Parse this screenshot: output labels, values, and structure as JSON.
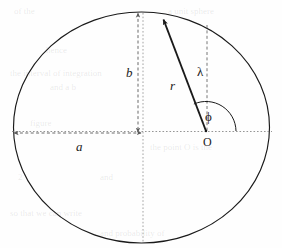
{
  "figure": {
    "type": "geometry-diagram",
    "background_color": "#fefefe",
    "stroke_color": "#1a1a1a",
    "guide_color": "#8a8a8a"
  },
  "labels": {
    "semi_major_axis": "a",
    "semi_minor_axis": "b",
    "radius": "r",
    "vertical_offset": "λ",
    "angle": "ϕ",
    "origin": "O"
  },
  "chart_data": {
    "type": "scatter",
    "title": "",
    "xlabel": "",
    "ylabel": "",
    "annotations": [
      {
        "name": "a",
        "text": "a",
        "meaning": "semi-major-axis",
        "x": 82,
        "y": 147
      },
      {
        "name": "b",
        "text": "b",
        "meaning": "semi-minor-axis",
        "x": 131,
        "y": 73
      },
      {
        "name": "r",
        "text": "r",
        "meaning": "radial-distance",
        "x": 174,
        "y": 86
      },
      {
        "name": "lambda",
        "text": "λ",
        "meaning": "vertical-ordinate",
        "x": 201,
        "y": 72
      },
      {
        "name": "phi",
        "text": "ϕ",
        "meaning": "polar-angle",
        "x": 210,
        "y": 117
      },
      {
        "name": "O",
        "text": "O",
        "meaning": "polar-origin",
        "x": 208,
        "y": 143
      }
    ],
    "geometry": {
      "ellipse": {
        "cx": 141.5,
        "cy": 127.5,
        "rx": 128,
        "ry": 115.5
      },
      "origin_point": {
        "x": 206,
        "y": 131
      },
      "point_on_ellipse": {
        "x": 162,
        "y": 18
      },
      "center_point": {
        "x": 142,
        "y": 131
      },
      "semi_major_measure": {
        "x1": 14,
        "x2": 141,
        "y": 133
      },
      "semi_minor_measure": {
        "x": 138,
        "y1": 13,
        "y2": 132
      },
      "lambda_measure": {
        "x": 207,
        "y1": 25,
        "y2": 131
      },
      "angle_arc_radius": 30
    }
  },
  "ghost_text": [
    {
      "text": "of the",
      "x": 14,
      "y": 6
    },
    {
      "text": "a unit sphere",
      "x": 168,
      "y": 6
    },
    {
      "text": "hence",
      "x": 46,
      "y": 45
    },
    {
      "text": "the interval of integration",
      "x": 10,
      "y": 68
    },
    {
      "text": "and a b",
      "x": 50,
      "y": 82
    },
    {
      "text": "figure",
      "x": 30,
      "y": 118
    },
    {
      "text": "the point O is the",
      "x": 150,
      "y": 142
    },
    {
      "text": "2",
      "x": 18,
      "y": 172
    },
    {
      "text": "and",
      "x": 100,
      "y": 172
    },
    {
      "text": "so that we can write",
      "x": 10,
      "y": 208
    },
    {
      "text": "and probability of",
      "x": 100,
      "y": 228
    }
  ]
}
